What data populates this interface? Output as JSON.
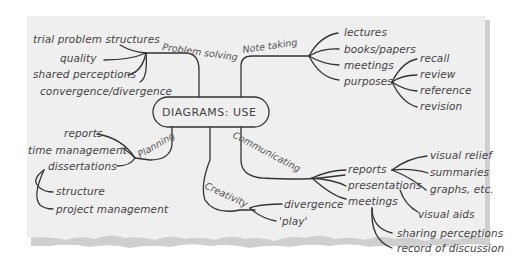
{
  "diagram": {
    "type": "mind-map",
    "center": "DIAGRAMS: USE",
    "colors": {
      "paper": "#efefef",
      "ink": "#333333",
      "text": "#444444",
      "shadow": "#9a9a9a"
    },
    "branches": {
      "problem_solving": {
        "label": "Problem solving",
        "children": [
          "trial problem structures",
          "quality",
          "shared perceptions",
          "convergence/divergence"
        ]
      },
      "note_taking": {
        "label": "Note taking",
        "children": [
          "lectures",
          "books/papers",
          "meetings",
          "purposes"
        ],
        "purposes": [
          "recall",
          "review",
          "reference",
          "revision"
        ]
      },
      "planning": {
        "label": "Planning",
        "children": [
          "reports",
          "time management",
          "dissertations"
        ],
        "dissertations": [
          "structure",
          "project management"
        ]
      },
      "communicating": {
        "label": "Communicating",
        "children": [
          "reports",
          "presentations",
          "meetings"
        ],
        "reports": [
          "visual relief",
          "summaries",
          "graphs, etc."
        ],
        "presentations": [
          "visual aids"
        ],
        "meetings": [
          "sharing perceptions",
          "record of discussion"
        ]
      },
      "creativity": {
        "label": "Creativity",
        "children": [
          "divergence",
          "'play'"
        ]
      }
    }
  }
}
